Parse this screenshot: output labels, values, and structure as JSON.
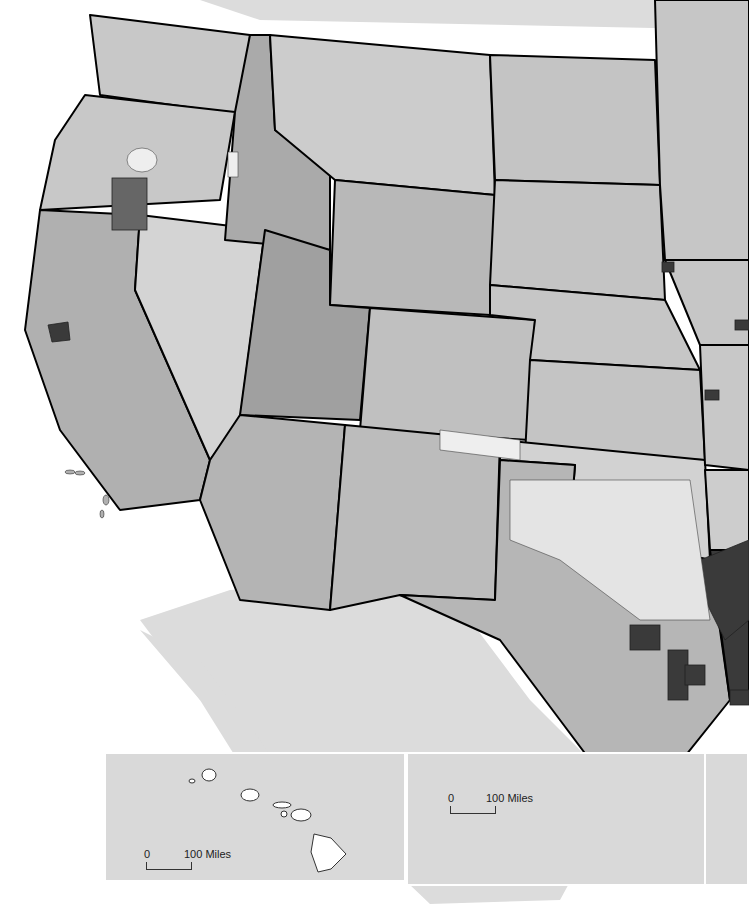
{
  "map": {
    "title": "",
    "region": "Western and Central United States by county",
    "colors": {
      "background": "#ffffff",
      "ocean_land_other": "#d9d9d9",
      "lightest": "#eeeeee",
      "light": "#cccccc",
      "medium": "#aaaaaa",
      "dark": "#777777",
      "darkest": "#333333",
      "county_border": "#444444",
      "state_border": "#000000"
    },
    "states_visible": [
      "Washington",
      "Oregon",
      "California",
      "Idaho",
      "Nevada",
      "Montana",
      "Wyoming",
      "Utah",
      "Arizona",
      "Colorado",
      "New Mexico",
      "North Dakota",
      "South Dakota",
      "Nebraska",
      "Kansas",
      "Oklahoma",
      "Texas",
      "Minnesota",
      "Iowa",
      "Missouri",
      "Arkansas",
      "Louisiana"
    ]
  },
  "insets": {
    "hawaii": {
      "label": "Hawaii",
      "scale_zero": "0",
      "scale_label": "100 Miles"
    },
    "texas_coast": {
      "scale_zero": "0",
      "scale_label": "100 Miles"
    }
  }
}
